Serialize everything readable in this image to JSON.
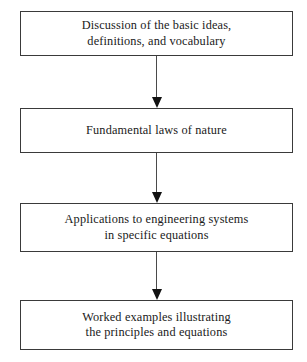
{
  "diagram": {
    "type": "flowchart",
    "orientation": "vertical",
    "title": "",
    "background_color": "#ffffff",
    "box_border_color": "#3a3a3a",
    "text_color": "#1a1a1a",
    "arrow_color": "#121212",
    "nodes": [
      {
        "id": "node-1",
        "label": "Discussion of the basic ideas,\ndefinitions, and vocabulary",
        "line1": "Discussion of the basic ideas,",
        "line2": "definitions, and vocabulary",
        "x": 20,
        "y": 11,
        "width": 273,
        "height": 45
      },
      {
        "id": "node-2",
        "label": "Fundamental laws of nature",
        "line1": "Fundamental laws of nature",
        "line2": "",
        "x": 20,
        "y": 108,
        "width": 273,
        "height": 45
      },
      {
        "id": "node-3",
        "label": "Applications to engineering systems\nin specific equations",
        "line1": "Applications to engineering systems",
        "line2": "in specific equations",
        "x": 20,
        "y": 203,
        "width": 273,
        "height": 49
      },
      {
        "id": "node-4",
        "label": "Worked examples illustrating\nthe principles and equations",
        "line1": "Worked examples illustrating",
        "line2": "the principles and equations",
        "x": 20,
        "y": 300,
        "width": 273,
        "height": 50
      }
    ],
    "connectors": [
      {
        "id": "arrow-1",
        "from": "node-1",
        "to": "node-2",
        "x": 149,
        "y": 56,
        "length": 52
      },
      {
        "id": "arrow-2",
        "from": "node-2",
        "to": "node-3",
        "x": 149,
        "y": 153,
        "length": 50
      },
      {
        "id": "arrow-3",
        "from": "node-3",
        "to": "node-4",
        "x": 149,
        "y": 252,
        "length": 48
      }
    ]
  }
}
